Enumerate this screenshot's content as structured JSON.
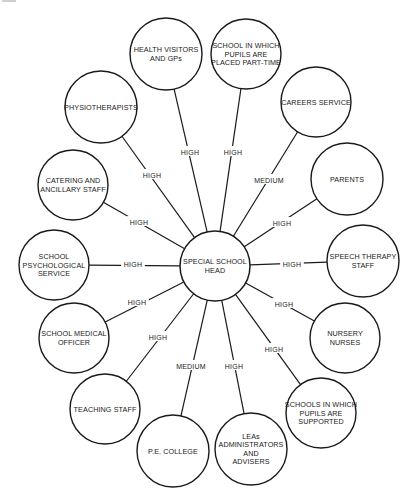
{
  "diagram": {
    "center": {
      "id": "head",
      "lines": [
        "SPECIAL SCHOOL",
        "HEAD"
      ],
      "x": 215,
      "y": 266,
      "r": 35
    },
    "nodes": [
      {
        "id": "health-visitors",
        "lines": [
          "HEALTH VISITORS",
          "AND GPs"
        ],
        "x": 166,
        "y": 54,
        "r": 36,
        "relation": "HIGH",
        "lx": 190,
        "ly": 152
      },
      {
        "id": "school-part-time",
        "lines": [
          "SCHOOL IN WHICH",
          "PUPILS ARE",
          "PLACED PART-TIME"
        ],
        "x": 246,
        "y": 54,
        "r": 35,
        "relation": "HIGH",
        "lx": 233,
        "ly": 152
      },
      {
        "id": "careers-service",
        "lines": [
          "CAREERS SERVICE"
        ],
        "x": 316,
        "y": 102,
        "r": 35,
        "relation": "MEDIUM",
        "lx": 269,
        "ly": 180
      },
      {
        "id": "parents",
        "lines": [
          "PARENTS"
        ],
        "x": 347,
        "y": 179,
        "r": 36,
        "relation": "HIGH",
        "lx": 282,
        "ly": 223
      },
      {
        "id": "speech-therapy",
        "lines": [
          "SPEECH THERAPY",
          "STAFF"
        ],
        "x": 363,
        "y": 261,
        "r": 36,
        "relation": "HIGH",
        "lx": 292,
        "ly": 264
      },
      {
        "id": "nursery-nurses",
        "lines": [
          "NURSERY",
          "NURSES"
        ],
        "x": 345,
        "y": 338,
        "r": 35,
        "relation": "HIGH",
        "lx": 284,
        "ly": 304
      },
      {
        "id": "schools-supported",
        "lines": [
          "SCHOOLS IN WHICH",
          "PUPILS ARE",
          "SUPPORTED"
        ],
        "x": 321,
        "y": 413,
        "r": 35,
        "relation": "HIGH",
        "lx": 274,
        "ly": 349
      },
      {
        "id": "leas",
        "lines": [
          "LEAs",
          "ADMINISTRATORS",
          "AND",
          "ADVISERS"
        ],
        "x": 251,
        "y": 449,
        "r": 36,
        "relation": "HIGH",
        "lx": 234,
        "ly": 366
      },
      {
        "id": "pe-college",
        "lines": [
          "P.E. COLLEGE"
        ],
        "x": 173,
        "y": 451,
        "r": 36,
        "relation": "MEDIUM",
        "lx": 191,
        "ly": 366
      },
      {
        "id": "teaching-staff",
        "lines": [
          "TEACHING STAFF"
        ],
        "x": 105,
        "y": 409,
        "r": 35,
        "relation": "HIGH",
        "lx": 158,
        "ly": 337
      },
      {
        "id": "school-medical-officer",
        "lines": [
          "SCHOOL MEDICAL",
          "OFFICER"
        ],
        "x": 74,
        "y": 338,
        "r": 35,
        "relation": "HIGH",
        "lx": 137,
        "ly": 302
      },
      {
        "id": "school-psychological-service",
        "lines": [
          "SCHOOL",
          "PSYCHOLOGICAL",
          "SERVICE"
        ],
        "x": 54,
        "y": 265,
        "r": 35,
        "relation": "HIGH",
        "lx": 133,
        "ly": 264
      },
      {
        "id": "catering-staff",
        "lines": [
          "CATERING AND",
          "ANCILLARY STAFF"
        ],
        "x": 73,
        "y": 185,
        "r": 35,
        "relation": "HIGH",
        "lx": 139,
        "ly": 222
      },
      {
        "id": "physiotherapists",
        "lines": [
          "PHYSIOTHERAPISTS"
        ],
        "x": 101,
        "y": 107,
        "r": 36,
        "relation": "HIGH",
        "lx": 152,
        "ly": 175
      }
    ]
  }
}
